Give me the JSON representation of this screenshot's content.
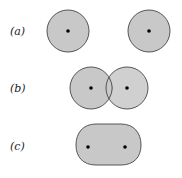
{
  "colors": {
    "fill": "#c8c8c8",
    "stroke": "#555555",
    "dot": "#000000",
    "label": "#222222"
  },
  "rows": [
    {
      "id": "a",
      "label": "(a)",
      "description": "two separated spheres"
    },
    {
      "id": "b",
      "label": "(b)",
      "description": "two overlapping spheres"
    },
    {
      "id": "c",
      "label": "(c)",
      "description": "merged elongated shape"
    }
  ]
}
